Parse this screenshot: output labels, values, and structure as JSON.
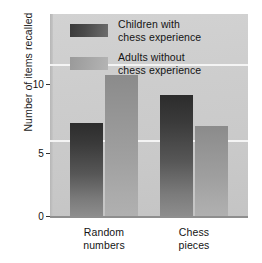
{
  "chart_data": {
    "type": "bar",
    "title": "",
    "subtitle": "",
    "xlabel": "",
    "ylabel": "Number of items recalled",
    "categories": [
      "Random numbers",
      "Chess pieces"
    ],
    "category_lines": [
      [
        "Random",
        "numbers"
      ],
      [
        "Chess",
        "pieces"
      ]
    ],
    "series": [
      {
        "name": "Children with chess experience",
        "name_lines": [
          "Children with",
          "chess experience"
        ],
        "values": [
          6.1,
          8.0
        ],
        "color": "#3a3a3a"
      },
      {
        "name": "Adults without chess experience",
        "name_lines": [
          "Adults without",
          "chess experience"
        ],
        "values": [
          9.3,
          5.9
        ],
        "color": "#a4a4a4"
      }
    ],
    "ylim": [
      0,
      13.3
    ],
    "yticks": [
      0,
      5,
      10
    ],
    "ytick_labels": [
      "0",
      "5",
      "10"
    ],
    "grid": true,
    "gridline_values": [
      5,
      10
    ],
    "legend_position": "inside-top-center",
    "plot_background": "#cdcdcd",
    "gridline_color": "#f4f4f4"
  },
  "axis": {
    "y_label": "Number of items recalled",
    "y_ticks": [
      "0",
      "5",
      "10"
    ]
  },
  "legend": {
    "items": [
      {
        "line1": "Children with",
        "line2": "chess experience"
      },
      {
        "line1": "Adults without",
        "line2": "chess experience"
      }
    ]
  },
  "x_categories": [
    {
      "line1": "Random",
      "line2": "numbers"
    },
    {
      "line1": "Chess",
      "line2": "pieces"
    }
  ]
}
